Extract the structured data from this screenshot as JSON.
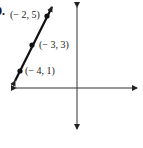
{
  "problem": {
    "number": "9."
  },
  "graph": {
    "type": "coordinate-plane-line",
    "axis_color": "#333333",
    "line_color": "#111111",
    "points": [
      {
        "label": "(− 2, 5)",
        "x": -2,
        "y": 5
      },
      {
        "label": "(− 3, 3)",
        "x": -3,
        "y": 3
      },
      {
        "label": "(− 4, 1)",
        "x": -4,
        "y": 1
      }
    ]
  }
}
